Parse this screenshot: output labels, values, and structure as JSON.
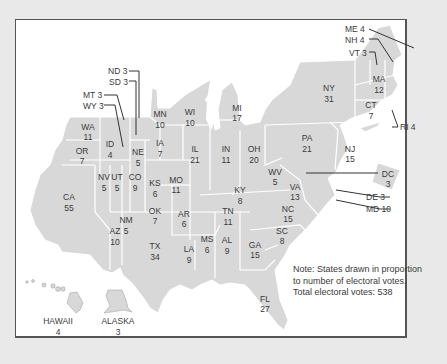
{
  "map": {
    "title": "Electoral college cartogram",
    "fill_color": "#d8d8d8",
    "border_color": "#ffffff",
    "text_color": "#3a3a3a",
    "states": [
      {
        "abbr": "WA",
        "votes": "11"
      },
      {
        "abbr": "OR",
        "votes": "7"
      },
      {
        "abbr": "CA",
        "votes": "55"
      },
      {
        "abbr": "ID",
        "votes": "4"
      },
      {
        "abbr": "NV",
        "votes": "5"
      },
      {
        "abbr": "UT",
        "votes": "5"
      },
      {
        "abbr": "AZ",
        "votes": "10"
      },
      {
        "abbr": "NM",
        "votes": "5"
      },
      {
        "abbr": "CO",
        "votes": "9"
      },
      {
        "abbr": "NE",
        "votes": "5"
      },
      {
        "abbr": "KS",
        "votes": "6"
      },
      {
        "abbr": "OK",
        "votes": "7"
      },
      {
        "abbr": "TX",
        "votes": "34"
      },
      {
        "abbr": "MN",
        "votes": "10"
      },
      {
        "abbr": "IA",
        "votes": "7"
      },
      {
        "abbr": "MO",
        "votes": "11"
      },
      {
        "abbr": "AR",
        "votes": "6"
      },
      {
        "abbr": "LA",
        "votes": "9"
      },
      {
        "abbr": "WI",
        "votes": "10"
      },
      {
        "abbr": "IL",
        "votes": "21"
      },
      {
        "abbr": "MS",
        "votes": "6"
      },
      {
        "abbr": "MI",
        "votes": "17"
      },
      {
        "abbr": "IN",
        "votes": "11"
      },
      {
        "abbr": "KY",
        "votes": "8"
      },
      {
        "abbr": "TN",
        "votes": "11"
      },
      {
        "abbr": "AL",
        "votes": "9"
      },
      {
        "abbr": "GA",
        "votes": "15"
      },
      {
        "abbr": "FL",
        "votes": "27"
      },
      {
        "abbr": "OH",
        "votes": "20"
      },
      {
        "abbr": "WV",
        "votes": "5"
      },
      {
        "abbr": "VA",
        "votes": "13"
      },
      {
        "abbr": "NC",
        "votes": "15"
      },
      {
        "abbr": "SC",
        "votes": "8"
      },
      {
        "abbr": "PA",
        "votes": "21"
      },
      {
        "abbr": "NY",
        "votes": "31"
      },
      {
        "abbr": "NJ",
        "votes": "15"
      },
      {
        "abbr": "MA",
        "votes": "12"
      },
      {
        "abbr": "CT",
        "votes": "7"
      },
      {
        "abbr": "DC",
        "votes": "3"
      }
    ],
    "callouts": [
      {
        "abbr": "ND",
        "votes": "3",
        "text": "ND 3"
      },
      {
        "abbr": "SD",
        "votes": "3",
        "text": "SD 3"
      },
      {
        "abbr": "MT",
        "votes": "3",
        "text": "MT 3"
      },
      {
        "abbr": "WY",
        "votes": "3",
        "text": "WY 3"
      },
      {
        "abbr": "ME",
        "votes": "4",
        "text": "ME 4"
      },
      {
        "abbr": "NH",
        "votes": "4",
        "text": "NH 4"
      },
      {
        "abbr": "VT",
        "votes": "3",
        "text": "VT 3"
      },
      {
        "abbr": "RI",
        "votes": "4",
        "text": "RI 4"
      },
      {
        "abbr": "DE",
        "votes": "3",
        "text": "DE 3"
      },
      {
        "abbr": "MD",
        "votes": "10",
        "text": "MD 10"
      }
    ],
    "insets": [
      {
        "name": "HAWAII",
        "votes": "4"
      },
      {
        "name": "ALASKA",
        "votes": "3"
      }
    ],
    "note": {
      "line1": "Note: States drawn in proportion",
      "line2": "to number of electoral votes.",
      "line3": "Total electoral votes: 538"
    }
  }
}
